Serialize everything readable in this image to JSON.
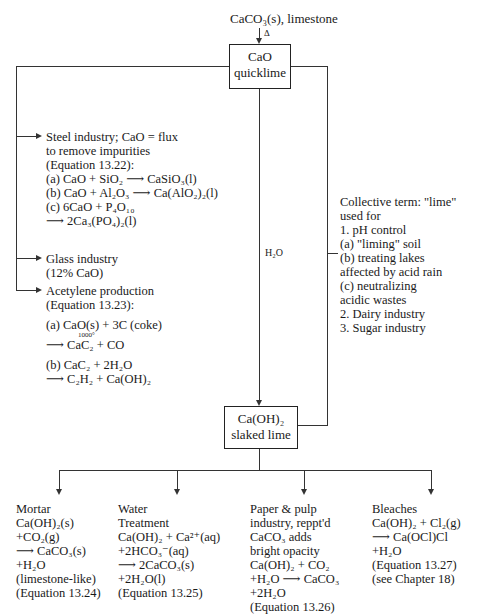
{
  "top": {
    "source": "CaCO₃(s), limestone",
    "heat_symbol": "Δ"
  },
  "quicklime_box": {
    "formula": "CaO",
    "name": "quicklime"
  },
  "slaked_box": {
    "formula": "Ca(OH)₂",
    "name": "slaked lime"
  },
  "water_label": "H₂O",
  "steel": {
    "lines": [
      "Steel industry; CaO = flux",
      "to remove impurities",
      "(Equation 13.22):",
      "(a)  CaO + SiO₂ ⟶ CaSiO₃(l)",
      "(b)  CaO + Al₂O₃ ⟶ Ca(AlO₂)₂(l)",
      "(c)  6CaO + P₄O₁₀",
      "        ⟶ 2Ca₃(PO₄)₂(l)"
    ]
  },
  "glass": {
    "lines": [
      "Glass industry",
      "(12% CaO)"
    ]
  },
  "acetylene": {
    "lines": [
      "Acetylene production",
      "(Equation 13.23):",
      "(a)  CaO(s) + 3C (coke)",
      "1000°",
      "       ⟶ CaC₂ + CO",
      "(b)  CaC₂ + 2H₂O",
      "       ⟶ C₂H₂ + Ca(OH)₂"
    ]
  },
  "lime_uses": {
    "lines": [
      "Collective term: \"lime\"",
      "used for",
      "1. pH control",
      "  (a)  \"liming\" soil",
      "  (b)  treating lakes",
      "         affected by acid rain",
      "  (c)  neutralizing",
      "         acidic wastes",
      "2. Dairy industry",
      "3. Sugar industry"
    ]
  },
  "bottom": [
    {
      "lines": [
        "Mortar",
        "Ca(OH)₂(s)",
        "+CO₂(g)",
        "⟶ CaCO₃(s)",
        "+H₂O",
        "(limestone-like)",
        "(Equation 13.24)"
      ]
    },
    {
      "lines": [
        "Water",
        "Treatment",
        "Ca(OH)₂ + Ca²⁺(aq)",
        "+2HCO₃⁻(aq)",
        "⟶ 2CaCO₃(s)",
        "+2H₂O(l)",
        "(Equation 13.25)"
      ]
    },
    {
      "lines": [
        "Paper & pulp",
        "industry, reppt'd",
        "CaCO₃ adds",
        "bright opacity",
        "Ca(OH)₂ + CO₂",
        "+H₂O ⟶ CaCO₃",
        "+2H₂O",
        "(Equation 13.26)"
      ]
    },
    {
      "lines": [
        "Bleaches",
        "Ca(OH)₂ + Cl₂(g)",
        "⟶ Ca(OCl)Cl",
        "+H₂O",
        "(Equation 13.27)",
        "(see Chapter 18)"
      ]
    }
  ]
}
